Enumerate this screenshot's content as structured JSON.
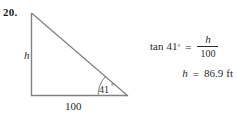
{
  "problem": {
    "number": "20."
  },
  "figure": {
    "type": "right-triangle-diagram",
    "vertical_leg_label": "h",
    "horizontal_leg_label": "100",
    "angle_label": "41",
    "angle_degree_symbol": "°",
    "stroke_color": "#808080",
    "label_color": "#2b2b2b",
    "geometry": {
      "apex": {
        "x": 31,
        "y": 13
      },
      "right_angle_corner": {
        "x": 31,
        "y": 96
      },
      "angle_vertex": {
        "x": 128,
        "y": 96
      },
      "arc_radius": 30
    }
  },
  "equations": {
    "line1": {
      "function": "tan",
      "angle": "41",
      "degree": "°",
      "equals": "=",
      "numerator": "h",
      "denominator": "100"
    },
    "line2": {
      "variable": "h",
      "equals": "=",
      "value": "86.9",
      "unit": "ft"
    }
  }
}
